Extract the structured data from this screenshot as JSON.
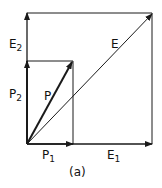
{
  "diagram": {
    "caption": "(a)",
    "colors": {
      "ink": "#1a1a1a",
      "background": "#ffffff"
    },
    "vectors": {
      "E": {
        "label": "E",
        "sub": ""
      },
      "P": {
        "label": "P",
        "sub": ""
      },
      "E1": {
        "label": "E",
        "sub": "1"
      },
      "E2": {
        "label": "E",
        "sub": "2"
      },
      "P1": {
        "label": "P",
        "sub": "1"
      },
      "P2": {
        "label": "P",
        "sub": "2"
      }
    },
    "shapes": {
      "outer_rectangle": "E-components box",
      "inner_rectangle": "P-components box"
    }
  }
}
